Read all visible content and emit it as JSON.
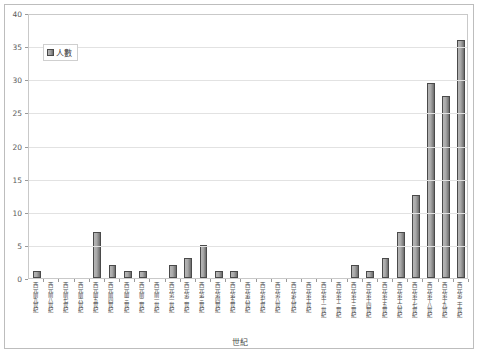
{
  "chart_data": {
    "type": "bar",
    "title": "",
    "xlabel": "世紀",
    "ylabel": "",
    "ylim": [
      0,
      40
    ],
    "ytick_step": 5,
    "yticks": [
      "0",
      "5",
      "10",
      "15",
      "20",
      "25",
      "30",
      "35",
      "40"
    ],
    "grid": true,
    "legend_position": "top-left",
    "legend": [
      "人數"
    ],
    "series_name": "人數",
    "bar_color": "#9a9a9a",
    "bar_border_color": "#4a4a4a",
    "categories": [
      "西元前九世紀",
      "西元前八世紀",
      "西元前七世紀",
      "西元前六世紀",
      "西元前五世紀",
      "西元前四世紀",
      "西元前三世紀",
      "西元前二世紀",
      "西元前一世紀",
      "西元第一世紀",
      "西元第二世紀",
      "西元第三世紀",
      "西元第四世紀",
      "西元第五世紀",
      "西元第六世紀",
      "西元第七世紀",
      "西元第八世紀",
      "西元第九世紀",
      "西元第十世紀",
      "西元第十一世紀",
      "西元第十二世紀",
      "西元第十三世紀",
      "西元第十四世紀",
      "西元第十五世紀",
      "西元第十六世紀",
      "西元第十七世紀",
      "西元第十八世紀",
      "西元第十九世紀",
      "西元第二十世紀"
    ],
    "values": [
      1,
      0,
      0,
      0,
      7,
      2,
      1,
      1,
      0,
      2,
      3,
      5,
      1,
      1,
      0,
      0,
      0,
      0,
      0,
      0,
      0,
      2,
      1,
      3,
      7,
      12.5,
      29.5,
      27.5,
      36
    ]
  }
}
